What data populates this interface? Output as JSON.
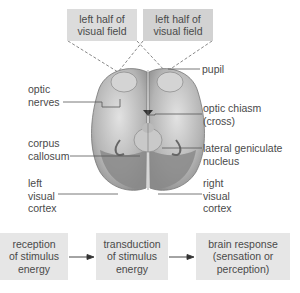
{
  "visual_fields": {
    "left_box": "left half of\nvisual field",
    "right_box": "left half of\nvisual field"
  },
  "labels": {
    "pupil": "pupil",
    "optic_nerves": "optic\nnerves",
    "optic_chiasm": "optic chiasm\n(cross)",
    "corpus_callosum": "corpus\ncallosum",
    "lateral_geniculate": "lateral geniculate\nnucleus",
    "left_visual_cortex": "left\nvisual\ncortex",
    "right_visual_cortex": "right\nvisual\ncortex"
  },
  "flow": {
    "steps": [
      "reception\nof stimulus\nenergy",
      "transduction\nof stimulus\nenergy",
      "brain response\n(sensation or\nperception)"
    ]
  },
  "colors": {
    "brain_light": "#d8d8d8",
    "brain_mid": "#a8a8a8",
    "brain_dark": "#7a7a7a",
    "box_gray": "#dcdcdc",
    "flow_box": "#e6e6e6"
  }
}
